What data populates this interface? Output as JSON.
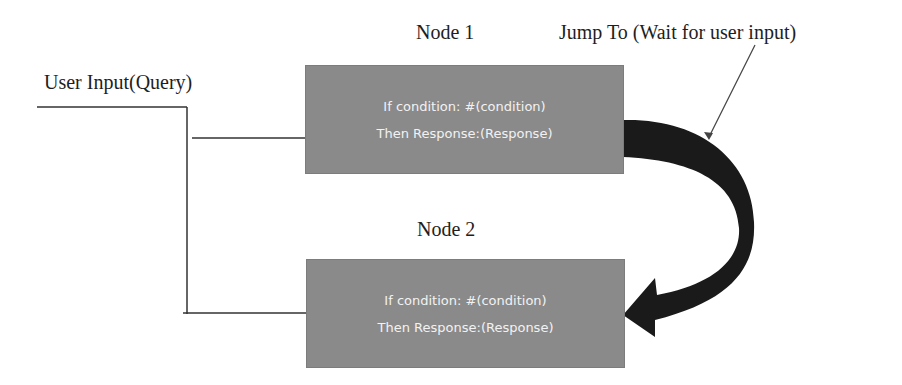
{
  "diagram": {
    "user_input_label": "User Input(Query)",
    "jump_label": "Jump To (Wait for user input)",
    "nodes": [
      {
        "title": "Node 1",
        "condition_text": "If condition: #(condition)",
        "response_text": "Then Response:(Response)"
      },
      {
        "title": "Node 2",
        "condition_text": "If condition: #(condition)",
        "response_text": "Then Response:(Response)"
      }
    ],
    "colors": {
      "node_fill": "#8a8a8a",
      "node_text": "#f2f2f2",
      "arrow_fill": "#1a1a1a",
      "line": "#333333",
      "background": "#ffffff"
    }
  }
}
